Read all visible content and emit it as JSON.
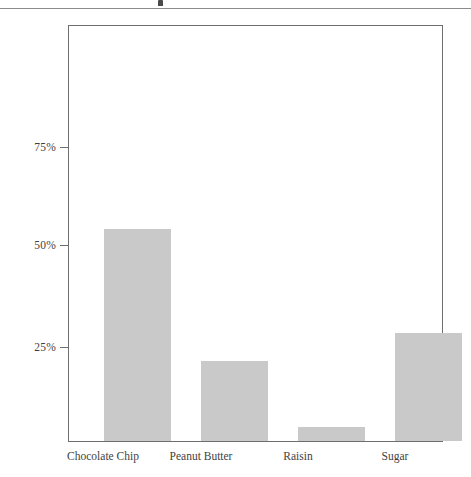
{
  "page": {
    "top_rule": "horizontal-rule",
    "clipped_text_artifact": "partial-glyph"
  },
  "chart_data": {
    "type": "bar",
    "title": "",
    "subtitle": "",
    "xlabel": "",
    "ylabel": "",
    "categories": [
      "Chocolate Chip",
      "Peanut Butter",
      "Raisin",
      "Sugar"
    ],
    "values": [
      53,
      20,
      3.5,
      27
    ],
    "value_unit": "%",
    "ytick_labels": [
      "25%",
      "50%",
      "75%"
    ],
    "ytick_values": [
      25,
      50,
      75
    ],
    "ylim": [
      0,
      104
    ],
    "xlim_categories": 4,
    "grid": false,
    "legend": false,
    "legend_position": "none",
    "bar_color": "#c9c9c9",
    "frame_color": "#6e6e6e",
    "text_color": "#3f3f3f",
    "series": [
      {
        "name": "Cookie preference",
        "values": [
          53,
          20,
          3.5,
          27
        ]
      }
    ]
  }
}
